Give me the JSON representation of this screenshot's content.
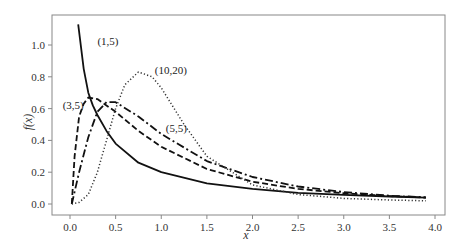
{
  "chart_data": {
    "type": "line",
    "title": "",
    "xlabel": "x",
    "ylabel": "f(x)",
    "xlim": [
      -0.2,
      4.1
    ],
    "ylim": [
      -0.07,
      1.2
    ],
    "xticks": [
      0.0,
      0.5,
      1.0,
      1.5,
      2.0,
      2.5,
      3.0,
      3.5,
      4.0
    ],
    "xtick_labels": [
      "0.0",
      "0.5",
      "1.0",
      "1.5",
      "2.0",
      "2.5",
      "3.0",
      "3.5",
      "4.0"
    ],
    "yticks": [
      0.0,
      0.2,
      0.4,
      0.6,
      0.8,
      1.0
    ],
    "ytick_labels": [
      "0.0",
      "0.2",
      "0.4",
      "0.6",
      "0.8",
      "1.0"
    ],
    "grid": false,
    "legend": "none (inline annotations)",
    "series": [
      {
        "name": "(1,5)",
        "style": "solid",
        "color": "#111111",
        "annotation": {
          "text": "(1,5)",
          "x": 0.3,
          "y": 1.0
        },
        "points": [
          [
            0.09,
            1.13
          ],
          [
            0.15,
            0.85
          ],
          [
            0.2,
            0.7
          ],
          [
            0.25,
            0.62
          ],
          [
            0.3,
            0.56
          ],
          [
            0.4,
            0.46
          ],
          [
            0.5,
            0.38
          ],
          [
            0.75,
            0.26
          ],
          [
            1.0,
            0.2
          ],
          [
            1.5,
            0.13
          ],
          [
            2.0,
            0.095
          ],
          [
            2.5,
            0.07
          ],
          [
            3.0,
            0.058
          ],
          [
            3.5,
            0.047
          ],
          [
            3.9,
            0.04
          ]
        ]
      },
      {
        "name": "(3,5)",
        "style": "dashed",
        "color": "#111111",
        "annotation": {
          "text": "(3,5)",
          "x": -0.08,
          "y": 0.6
        },
        "points": [
          [
            0.02,
            0.0
          ],
          [
            0.05,
            0.3
          ],
          [
            0.1,
            0.55
          ],
          [
            0.15,
            0.63
          ],
          [
            0.2,
            0.67
          ],
          [
            0.3,
            0.66
          ],
          [
            0.5,
            0.58
          ],
          [
            0.75,
            0.46
          ],
          [
            1.0,
            0.36
          ],
          [
            1.5,
            0.22
          ],
          [
            2.0,
            0.14
          ],
          [
            2.5,
            0.095
          ],
          [
            3.0,
            0.068
          ],
          [
            3.5,
            0.05
          ],
          [
            3.9,
            0.04
          ]
        ]
      },
      {
        "name": "(5,5)",
        "style": "dashdot",
        "color": "#111111",
        "annotation": {
          "text": "(5,5)",
          "x": 1.05,
          "y": 0.45
        },
        "points": [
          [
            0.02,
            0.0
          ],
          [
            0.1,
            0.2
          ],
          [
            0.2,
            0.42
          ],
          [
            0.3,
            0.58
          ],
          [
            0.4,
            0.64
          ],
          [
            0.5,
            0.64
          ],
          [
            0.75,
            0.55
          ],
          [
            1.0,
            0.44
          ],
          [
            1.5,
            0.27
          ],
          [
            2.0,
            0.17
          ],
          [
            2.5,
            0.11
          ],
          [
            3.0,
            0.075
          ],
          [
            3.5,
            0.052
          ],
          [
            3.9,
            0.042
          ]
        ]
      },
      {
        "name": "(10,20)",
        "style": "dotted",
        "color": "#333333",
        "annotation": {
          "text": "(10,20)",
          "x": 0.93,
          "y": 0.82
        },
        "points": [
          [
            0.02,
            0.0
          ],
          [
            0.1,
            0.01
          ],
          [
            0.2,
            0.06
          ],
          [
            0.3,
            0.2
          ],
          [
            0.4,
            0.4
          ],
          [
            0.5,
            0.6
          ],
          [
            0.6,
            0.75
          ],
          [
            0.75,
            0.83
          ],
          [
            0.9,
            0.8
          ],
          [
            1.0,
            0.73
          ],
          [
            1.25,
            0.5
          ],
          [
            1.5,
            0.3
          ],
          [
            2.0,
            0.12
          ],
          [
            2.5,
            0.06
          ],
          [
            3.0,
            0.035
          ],
          [
            3.5,
            0.025
          ],
          [
            3.9,
            0.02
          ]
        ]
      }
    ]
  },
  "colors": {
    "background": "#ffffff",
    "frame": "#888888",
    "text": "#333333"
  }
}
